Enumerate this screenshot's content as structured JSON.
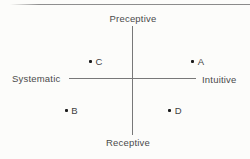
{
  "chart_data": {
    "type": "scatter",
    "title": "",
    "axes": {
      "vertical": {
        "top_label": "Preceptive",
        "bottom_label": "Receptive"
      },
      "horizontal": {
        "left_label": "Systematic",
        "right_label": "Intuitive"
      }
    },
    "grid": false,
    "legend": false,
    "points": [
      {
        "label": "A",
        "x": 0.98,
        "y": 0.32,
        "quadrant": "Preceptive-Intuitive"
      },
      {
        "label": "C",
        "x": -0.67,
        "y": 0.32,
        "quadrant": "Preceptive-Systematic"
      },
      {
        "label": "B",
        "x": -1.06,
        "y": -0.57,
        "quadrant": "Receptive-Systematic"
      },
      {
        "label": "D",
        "x": 0.61,
        "y": -0.57,
        "quadrant": "Receptive-Intuitive"
      }
    ]
  }
}
